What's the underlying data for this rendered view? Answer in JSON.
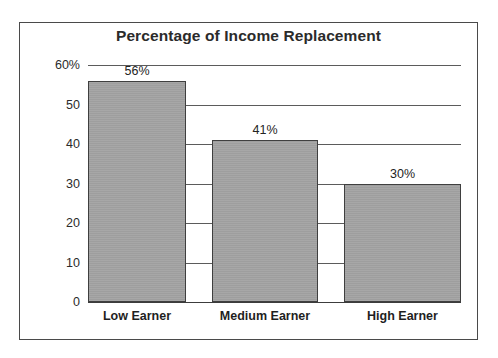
{
  "chart_data": {
    "type": "bar",
    "title": "Percentage of Income Replacement",
    "xlabel": "",
    "ylabel": "",
    "categories": [
      "Low Earner",
      "Medium Earner",
      "High Earner"
    ],
    "values": [
      56,
      41,
      30
    ],
    "data_labels": [
      "56%",
      "41%",
      "30%"
    ],
    "ylim": [
      0,
      60
    ],
    "ytick_values": [
      60,
      50,
      40,
      30,
      20,
      10,
      0
    ],
    "ytick_labels": [
      "60%",
      "50",
      "40",
      "30",
      "20",
      "10",
      "0"
    ],
    "gridlines": [
      60,
      50,
      40,
      30,
      20,
      10
    ],
    "grid": true,
    "legend": "none",
    "bar_color": "#a3a3a3",
    "bar_border_color": "#3f3f3f",
    "axis_color": "#3c3c3c",
    "grid_color": "#5b5b5b",
    "frame_color": "#4a4a4a",
    "background": "#ffffff",
    "text_color": "#2b2b2b"
  },
  "yticks": [
    {
      "label": "60%",
      "value": 60
    },
    {
      "label": "50",
      "value": 50
    },
    {
      "label": "40",
      "value": 40
    },
    {
      "label": "30",
      "value": 30
    },
    {
      "label": "20",
      "value": 20
    },
    {
      "label": "10",
      "value": 10
    },
    {
      "label": "0",
      "value": 0
    }
  ],
  "bars": [
    {
      "category": "Low Earner",
      "value": 56,
      "label": "56%"
    },
    {
      "category": "Medium Earner",
      "value": 41,
      "label": "41%"
    },
    {
      "category": "High Earner",
      "value": 30,
      "label": "30%"
    }
  ]
}
